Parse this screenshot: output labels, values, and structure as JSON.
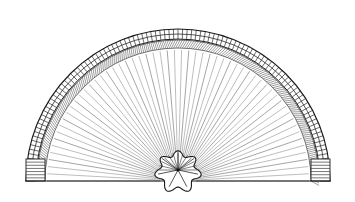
{
  "image": {
    "title": "Semicircular folding hand fan",
    "subject": "fan",
    "style": "black and white line drawing",
    "background_color": "#ffffff",
    "width": 355,
    "height": 202,
    "caption": ""
  },
  "geometry": {
    "center_x": 178,
    "center_y": 181,
    "baseline_y": 181,
    "left_edge_x": 25,
    "right_edge_x": 331,
    "top_y": 12,
    "outer_radius": 153,
    "rim_outer_radius": 152,
    "rim_inner_radius": 142,
    "fringe_outer_radius": 141,
    "fringe_inner_radius": 133,
    "rib_outer_radius": 131,
    "hub_radius": 20,
    "start_angle_deg": 180,
    "end_angle_deg": 360
  },
  "parts": {
    "rim": {
      "name": "outer rim band",
      "rung_count": 104,
      "stroke_color": "#1a1a1a"
    },
    "fringe": {
      "name": "inner hatched fringe band",
      "stroke_count": 190,
      "stroke_color": "#4a4a4a"
    },
    "ribs": {
      "name": "radiating fan ribs",
      "count": 57,
      "stroke_color": "#5a5a5a"
    },
    "hub": {
      "name": "rosette knot hub",
      "lobe_count": 7,
      "ray_count": 13,
      "stroke_color": "#1a1a1a"
    },
    "terminals": {
      "name": "guard stick end blocks",
      "count": 2,
      "rung_count": 7
    },
    "baseline": {
      "name": "fan base edge",
      "stroke_color": "#1a1a1a"
    }
  }
}
